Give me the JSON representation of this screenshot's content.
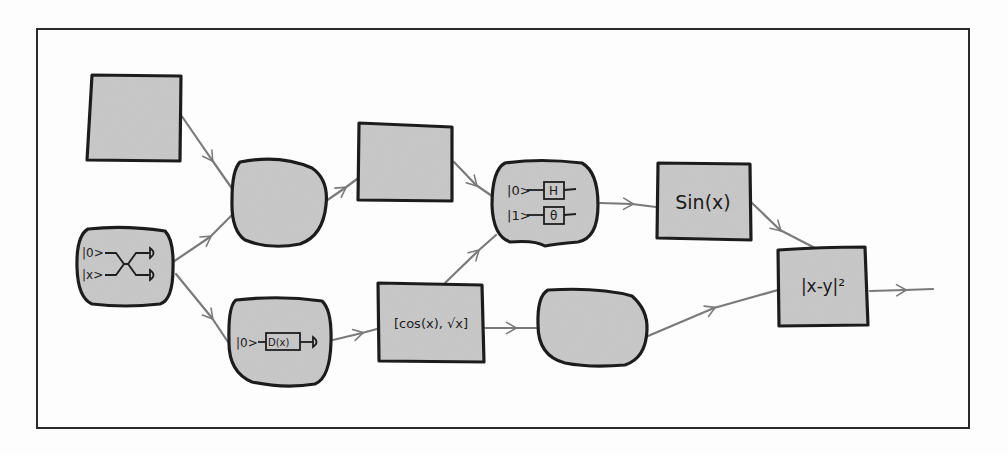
{
  "diagram": {
    "type": "hybrid-computation-graph",
    "style": "hand-drawn",
    "colors": {
      "background": "#fdfdfd",
      "frame": "#2a2a2a",
      "node_fill": "#c9c9c9",
      "node_stroke": "#1e1e1e",
      "edge": "#7a7a7a"
    },
    "nodes": [
      {
        "id": "n1",
        "shape": "square",
        "label": ""
      },
      {
        "id": "n2",
        "shape": "blob",
        "label": ""
      },
      {
        "id": "n3",
        "shape": "rectangle",
        "label": ""
      },
      {
        "id": "n4",
        "shape": "blob",
        "label": "quantum circuit",
        "circuit": {
          "qubits": [
            "|0>",
            "|1>"
          ],
          "gates": [
            "H",
            "θ"
          ]
        }
      },
      {
        "id": "n5",
        "shape": "rectangle",
        "label": "Sin(x)"
      },
      {
        "id": "n6",
        "shape": "blob",
        "label": "quantum circuit",
        "circuit": {
          "qubits": [
            "|0>",
            "|x>"
          ],
          "gates": [
            "swap"
          ],
          "outputs": [
            "measure",
            "measure"
          ]
        }
      },
      {
        "id": "n7",
        "shape": "blob",
        "label": "quantum circuit",
        "circuit": {
          "qubits": [
            "|0>"
          ],
          "gates": [
            "D(x)"
          ],
          "outputs": [
            "measure"
          ]
        }
      },
      {
        "id": "n8",
        "shape": "rectangle",
        "label": "[cos(x), √x]"
      },
      {
        "id": "n9",
        "shape": "blob",
        "label": ""
      },
      {
        "id": "n10",
        "shape": "rectangle",
        "label": "|x-y|²"
      }
    ],
    "edges": [
      {
        "from": "n1",
        "to": "n2"
      },
      {
        "from": "n6",
        "to": "n2"
      },
      {
        "from": "n6",
        "to": "n7"
      },
      {
        "from": "n2",
        "to": "n3"
      },
      {
        "from": "n3",
        "to": "n4"
      },
      {
        "from": "n8",
        "to": "n4"
      },
      {
        "from": "n7",
        "to": "n8"
      },
      {
        "from": "n4",
        "to": "n5"
      },
      {
        "from": "n8",
        "to": "n9"
      },
      {
        "from": "n5",
        "to": "n10"
      },
      {
        "from": "n9",
        "to": "n10"
      },
      {
        "from": "n10",
        "to": "output"
      }
    ],
    "text": {
      "n4_q0": "|0>",
      "n4_q1": "|1>",
      "n4_g0": "H",
      "n4_g1": "θ",
      "n5": "Sin(x)",
      "n6_q0": "|0>",
      "n6_q1": "|x>",
      "n7_q0": "|0>",
      "n7_g0": "D(x)",
      "n8": "[cos(x), √x]",
      "n10": "|x-y|²"
    }
  }
}
